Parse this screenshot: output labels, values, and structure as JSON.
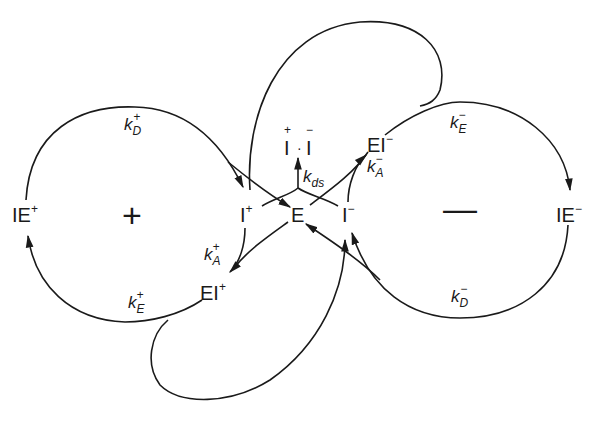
{
  "diagram": {
    "type": "reaction-scheme",
    "species": {
      "IE_plus": {
        "base": "IE",
        "charge": "+"
      },
      "I_plus": {
        "base": "I",
        "charge": "+"
      },
      "E": {
        "base": "E"
      },
      "I_minus": {
        "base": "I",
        "charge": "−"
      },
      "EI_plus": {
        "base": "EI",
        "charge": "+"
      },
      "EI_minus": {
        "base": "EI",
        "charge": "−"
      },
      "IE_minus": {
        "base": "IE",
        "charge": "−"
      },
      "ion_pair": {
        "left": "I",
        "left_charge": "+",
        "dot": "·",
        "right": "I",
        "right_charge": "−"
      }
    },
    "rate_constants": {
      "kD_plus": {
        "k": "k",
        "sub": "D",
        "sup": "+"
      },
      "kE_plus": {
        "k": "k",
        "sub": "E",
        "sup": "+"
      },
      "kA_plus": {
        "k": "k",
        "sub": "A",
        "sup": "+"
      },
      "kds": {
        "k": "k",
        "sub": "ds"
      },
      "kA_minus": {
        "k": "k",
        "sub": "A",
        "sup": "−"
      },
      "kE_minus": {
        "k": "k",
        "sub": "E",
        "sup": "−"
      },
      "kD_minus": {
        "k": "k",
        "sub": "D",
        "sup": "−"
      }
    },
    "cycles": {
      "positive": {
        "sign": "+"
      },
      "negative": {
        "sign": "—"
      }
    },
    "stroke_color": "#1a1a1a",
    "background": "#ffffff"
  }
}
